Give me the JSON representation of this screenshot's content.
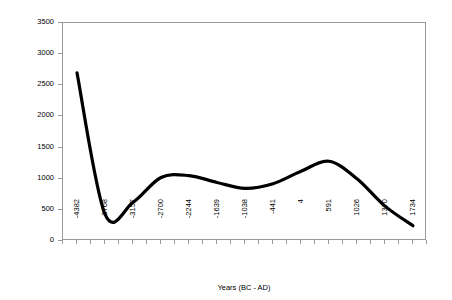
{
  "chart_data": {
    "type": "line",
    "title": "",
    "xlabel": "Years (BC - AD)",
    "ylabel": "Arboreal Pollen Count",
    "ylim": [
      0,
      3500
    ],
    "ytick_step": 500,
    "yticks": [
      "0",
      "500",
      "1000",
      "1500",
      "2000",
      "2500",
      "3000",
      "3500"
    ],
    "grid": false,
    "legend": false,
    "legend_position": "none",
    "line_color": "#000000",
    "frame_color": "#9a9a9a",
    "categories": [
      "-4382",
      "-3768",
      "-3157",
      "-2700",
      "-2244",
      "-1639",
      "-1038",
      "-441",
      "4",
      "591",
      "1026",
      "1370",
      "1734"
    ],
    "xtick_labels": [
      "-4382",
      "-3768",
      "-3157",
      "-2700",
      "-2244",
      "-1639",
      "-1038",
      "-441",
      "4",
      "591",
      "1026",
      "1370",
      "1734"
    ],
    "series": [
      {
        "name": "Arboreal Pollen Count",
        "values": [
          2700,
          430,
          620,
          1020,
          1050,
          940,
          845,
          920,
          1120,
          1280,
          1000,
          560,
          245
        ]
      }
    ],
    "annotations": {
      "start_value": 2700,
      "first_minimum": 400,
      "first_minimum_near": "-3600",
      "first_maximum": 1055,
      "first_maximum_near": "-2350",
      "mid_dip": 845,
      "mid_dip_near": "-1100",
      "second_maximum": 1285,
      "second_maximum_near": "591",
      "second_minimum": 230,
      "second_minimum_near": "1650",
      "end_value": 1030
    }
  }
}
